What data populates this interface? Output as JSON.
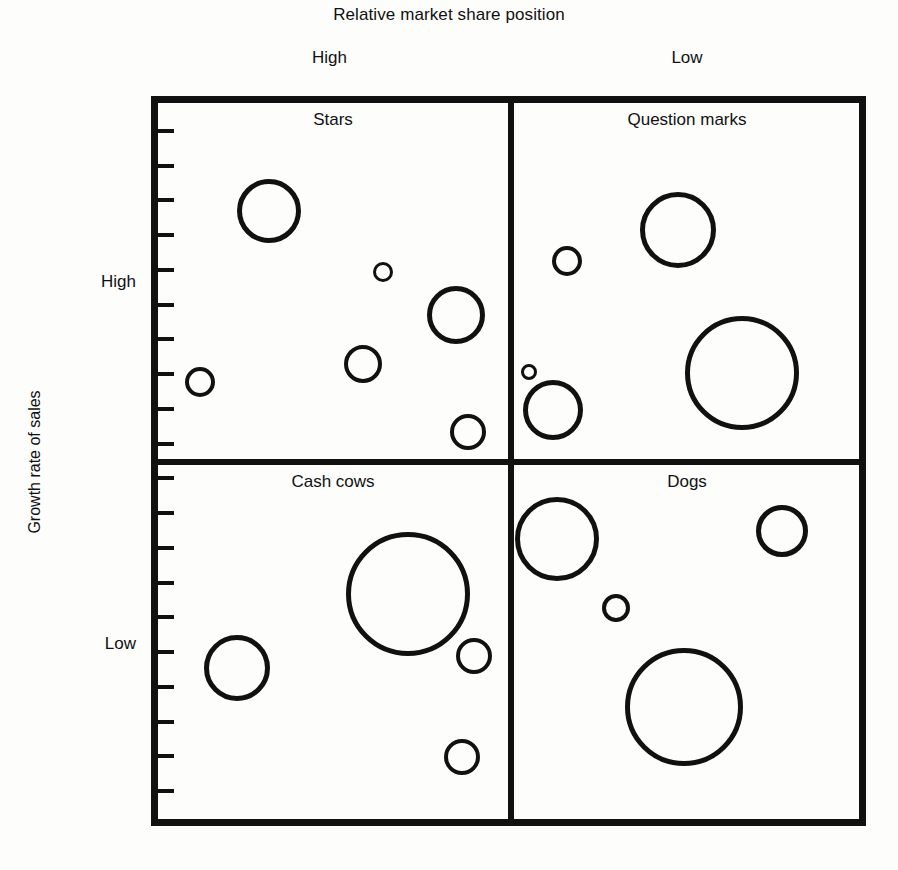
{
  "chart_data": {
    "type": "scatter",
    "title": "Relative market share position",
    "xlabel": "Relative market share position",
    "ylabel": "Growth rate of sales",
    "x_axis": {
      "label": "Relative market share position",
      "tick_labels": [
        "High",
        "Low"
      ],
      "direction": "high-to-low"
    },
    "y_axis": {
      "label": "Growth rate of sales",
      "tick_labels": [
        "High",
        "Low"
      ],
      "direction": "high-to-low",
      "minor_tick_count": 20
    },
    "grid": false,
    "legend": "none",
    "quadrants": [
      {
        "name": "Stars",
        "market_share": "High",
        "growth_rate": "High",
        "position": "top-left",
        "bubbles": [
          {
            "cx": 269,
            "cy": 211,
            "r": 32
          },
          {
            "cx": 383,
            "cy": 272,
            "r": 10
          },
          {
            "cx": 456,
            "cy": 315,
            "r": 29
          },
          {
            "cx": 363,
            "cy": 364,
            "r": 19
          },
          {
            "cx": 200,
            "cy": 382,
            "r": 15
          },
          {
            "cx": 468,
            "cy": 432,
            "r": 18
          }
        ]
      },
      {
        "name": "Question marks",
        "market_share": "Low",
        "growth_rate": "High",
        "position": "top-right",
        "bubbles": [
          {
            "cx": 678,
            "cy": 230,
            "r": 38
          },
          {
            "cx": 567,
            "cy": 261,
            "r": 15
          },
          {
            "cx": 529,
            "cy": 372,
            "r": 8
          },
          {
            "cx": 553,
            "cy": 410,
            "r": 30
          },
          {
            "cx": 742,
            "cy": 373,
            "r": 57
          }
        ]
      },
      {
        "name": "Cash cows",
        "market_share": "High",
        "growth_rate": "Low",
        "position": "bottom-left",
        "bubbles": [
          {
            "cx": 408,
            "cy": 594,
            "r": 62
          },
          {
            "cx": 237,
            "cy": 668,
            "r": 33
          },
          {
            "cx": 474,
            "cy": 656,
            "r": 18
          },
          {
            "cx": 462,
            "cy": 757,
            "r": 18
          }
        ]
      },
      {
        "name": "Dogs",
        "market_share": "Low",
        "growth_rate": "Low",
        "position": "bottom-right",
        "bubbles": [
          {
            "cx": 557,
            "cy": 539,
            "r": 42
          },
          {
            "cx": 782,
            "cy": 531,
            "r": 26
          },
          {
            "cx": 616,
            "cy": 608,
            "r": 14
          },
          {
            "cx": 684,
            "cy": 707,
            "r": 59
          }
        ]
      }
    ],
    "bubble_encoding": "circle area represents business unit sales volume",
    "total_bubbles": 19
  },
  "header": {
    "title": "Relative market share position",
    "column_high": "High",
    "column_low": "Low"
  },
  "y_axis": {
    "title": "Growth rate of sales",
    "high": "High",
    "low": "Low"
  },
  "quadrant_labels": {
    "stars": "Stars",
    "question_marks": "Question marks",
    "cash_cows": "Cash cows",
    "dogs": "Dogs"
  },
  "colors": {
    "ink": "#111111",
    "background": "#fdfdfc"
  }
}
